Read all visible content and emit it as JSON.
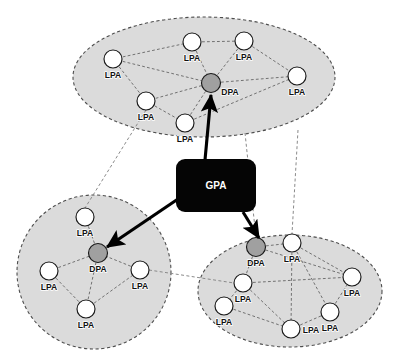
{
  "diagram": {
    "colors": {
      "cluster_fill": "#d9d9d9",
      "cluster_stroke": "#4d4d4d",
      "lpa_fill": "#ffffff",
      "dpa_fill": "#a0a0a0",
      "node_stroke": "#1a1a1a",
      "gpa_fill": "#050505",
      "gpa_text": "#ffffff",
      "intra_link": "#6b6b6b",
      "inter_link": "#8a8a8a",
      "arrow": "#000000",
      "background": "#ffffff"
    },
    "central": {
      "label": "GPA",
      "shape": "rounded-rectangle",
      "x": 176,
      "y": 159,
      "width": 80,
      "height": 53,
      "radius": 9
    },
    "clusters": [
      {
        "id": "cluster-top",
        "shape": "ellipse",
        "cx": 204,
        "cy": 77,
        "rx": 131,
        "ry": 60,
        "nodes": [
          {
            "id": "top-lpa-1",
            "label": "LPA",
            "type": "LPA",
            "cx": 113,
            "cy": 59,
            "r": 9,
            "label_dx": 0,
            "label_dy": 19
          },
          {
            "id": "top-lpa-2",
            "label": "LPA",
            "type": "LPA",
            "cx": 192,
            "cy": 42,
            "r": 9,
            "label_dx": 0,
            "label_dy": 19
          },
          {
            "id": "top-lpa-3",
            "label": "LPA",
            "type": "LPA",
            "cx": 244,
            "cy": 41,
            "r": 9,
            "label_dx": 0,
            "label_dy": 19
          },
          {
            "id": "top-lpa-4",
            "label": "LPA",
            "type": "LPA",
            "cx": 297,
            "cy": 76,
            "r": 9,
            "label_dx": 0,
            "label_dy": 19
          },
          {
            "id": "top-lpa-5",
            "label": "LPA",
            "type": "LPA",
            "cx": 146,
            "cy": 101,
            "r": 9,
            "label_dx": 0,
            "label_dy": 19
          },
          {
            "id": "top-lpa-6",
            "label": "LPA",
            "type": "LPA",
            "cx": 185,
            "cy": 123,
            "r": 9,
            "label_dx": 0,
            "label_dy": 19
          },
          {
            "id": "top-dpa",
            "label": "DPA",
            "type": "DPA",
            "cx": 211,
            "cy": 83,
            "r": 9.5,
            "label_dx": 19,
            "label_dy": 12
          }
        ],
        "links": [
          [
            "top-lpa-1",
            "top-lpa-2"
          ],
          [
            "top-lpa-2",
            "top-lpa-3"
          ],
          [
            "top-lpa-3",
            "top-lpa-4"
          ],
          [
            "top-lpa-1",
            "top-lpa-5"
          ],
          [
            "top-lpa-5",
            "top-lpa-6"
          ],
          [
            "top-lpa-5",
            "top-dpa"
          ],
          [
            "top-lpa-6",
            "top-dpa"
          ],
          [
            "top-lpa-2",
            "top-dpa"
          ],
          [
            "top-lpa-3",
            "top-dpa"
          ],
          [
            "top-dpa",
            "top-lpa-4"
          ],
          [
            "top-lpa-6",
            "top-lpa-4"
          ],
          [
            "top-lpa-1",
            "top-dpa"
          ]
        ]
      },
      {
        "id": "cluster-bottom-left",
        "shape": "ellipse",
        "cx": 94,
        "cy": 272,
        "rx": 77,
        "ry": 77,
        "nodes": [
          {
            "id": "bl-lpa-1",
            "label": "LPA",
            "type": "LPA",
            "cx": 85,
            "cy": 217,
            "r": 9,
            "label_dx": 0,
            "label_dy": 19
          },
          {
            "id": "bl-lpa-2",
            "label": "LPA",
            "type": "LPA",
            "cx": 49,
            "cy": 271,
            "r": 9,
            "label_dx": 0,
            "label_dy": 19
          },
          {
            "id": "bl-lpa-3",
            "label": "LPA",
            "type": "LPA",
            "cx": 140,
            "cy": 270,
            "r": 9,
            "label_dx": 0,
            "label_dy": 19
          },
          {
            "id": "bl-lpa-4",
            "label": "LPA",
            "type": "LPA",
            "cx": 86,
            "cy": 309,
            "r": 9,
            "label_dx": 0,
            "label_dy": 19
          },
          {
            "id": "bl-dpa",
            "label": "DPA",
            "type": "DPA",
            "cx": 98,
            "cy": 253,
            "r": 9.5,
            "label_dx": 0,
            "label_dy": 19
          }
        ],
        "links": [
          [
            "bl-lpa-1",
            "bl-dpa"
          ],
          [
            "bl-lpa-2",
            "bl-dpa"
          ],
          [
            "bl-lpa-3",
            "bl-dpa"
          ],
          [
            "bl-lpa-4",
            "bl-dpa"
          ],
          [
            "bl-lpa-2",
            "bl-lpa-4"
          ],
          [
            "bl-lpa-4",
            "bl-lpa-3"
          ]
        ]
      },
      {
        "id": "cluster-bottom-right",
        "shape": "ellipse",
        "cx": 290,
        "cy": 291,
        "rx": 92,
        "ry": 56,
        "nodes": [
          {
            "id": "br-lpa-1",
            "label": "LPA",
            "type": "LPA",
            "cx": 292,
            "cy": 243,
            "r": 9,
            "label_dx": 0,
            "label_dy": 19
          },
          {
            "id": "br-lpa-2",
            "label": "LPA",
            "type": "LPA",
            "cx": 352,
            "cy": 277,
            "r": 9,
            "label_dx": 0,
            "label_dy": 19
          },
          {
            "id": "br-lpa-3",
            "label": "LPA",
            "type": "LPA",
            "cx": 243,
            "cy": 283,
            "r": 9,
            "label_dx": 0,
            "label_dy": 19
          },
          {
            "id": "br-lpa-4",
            "label": "LPA",
            "type": "LPA",
            "cx": 224,
            "cy": 306,
            "r": 9,
            "label_dx": 0,
            "label_dy": 19
          },
          {
            "id": "br-lpa-5",
            "label": "LPA",
            "type": "LPA",
            "cx": 330,
            "cy": 312,
            "r": 9,
            "label_dx": 0,
            "label_dy": 19
          },
          {
            "id": "br-lpa-6",
            "label": "LPA",
            "type": "LPA",
            "cx": 291,
            "cy": 329,
            "r": 9,
            "label_dx": 20,
            "label_dy": 4
          },
          {
            "id": "br-dpa",
            "label": "DPA",
            "type": "DPA",
            "cx": 256,
            "cy": 247,
            "r": 9.5,
            "label_dx": 0,
            "label_dy": 19
          }
        ],
        "links": [
          [
            "br-dpa",
            "br-lpa-1"
          ],
          [
            "br-dpa",
            "br-lpa-3"
          ],
          [
            "br-lpa-1",
            "br-lpa-2"
          ],
          [
            "br-lpa-3",
            "br-lpa-4"
          ],
          [
            "br-lpa-3",
            "br-lpa-6"
          ],
          [
            "br-lpa-6",
            "br-lpa-5"
          ],
          [
            "br-lpa-5",
            "br-lpa-2"
          ],
          [
            "br-dpa",
            "br-lpa-2"
          ],
          [
            "br-lpa-1",
            "br-lpa-6"
          ],
          [
            "br-lpa-3",
            "br-lpa-2"
          ],
          [
            "br-lpa-4",
            "br-lpa-6"
          ],
          [
            "br-lpa-1",
            "br-lpa-5"
          ]
        ]
      }
    ],
    "command_links": [
      {
        "id": "gpa-to-top-dpa",
        "from": "GPA",
        "to": "top-dpa",
        "x1": 205,
        "y1": 160,
        "x2": 211,
        "y2": 95,
        "style": "solid-arrow"
      },
      {
        "id": "gpa-to-bottom-left-dpa",
        "from": "GPA",
        "to": "bl-dpa",
        "x1": 178,
        "y1": 199,
        "x2": 107,
        "y2": 247,
        "style": "solid-arrow"
      },
      {
        "id": "gpa-to-bottom-right-dpa",
        "from": "GPA",
        "to": "br-dpa",
        "x1": 243,
        "y1": 212,
        "x2": 259,
        "y2": 238,
        "style": "solid-arrow"
      }
    ],
    "peer_links": [
      {
        "id": "peer-top-to-bottom-left",
        "x1": 146,
        "y1": 110,
        "x2": 85,
        "y2": 208
      },
      {
        "id": "peer-bottom-left-to-bottom-right",
        "x1": 149,
        "y1": 270,
        "x2": 234,
        "y2": 283
      },
      {
        "id": "peer-top-to-bottom-right",
        "x1": 245,
        "y1": 133,
        "x2": 256,
        "y2": 238
      },
      {
        "id": "peer-top-right-to-bottom-right",
        "x1": 298,
        "y1": 130,
        "x2": 292,
        "y2": 234
      }
    ],
    "legend": {
      "gpa_meaning": "GPA",
      "dpa_meaning": "DPA",
      "lpa_meaning": "LPA"
    }
  }
}
